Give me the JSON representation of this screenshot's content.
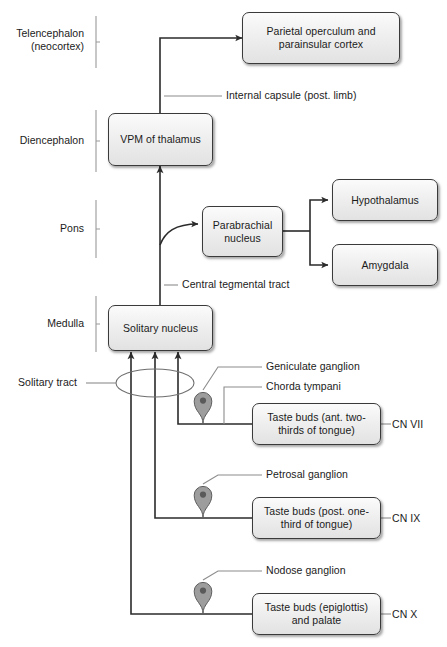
{
  "diagram": {
    "background_color": "#ffffff",
    "box_fill_top": "#fbfbfb",
    "box_fill_bottom": "#e2e2e2",
    "box_stroke": "#3a3a3a",
    "wire_color": "#2b2b2b",
    "leader_color": "#8c8c8c",
    "ganglion_fill": "#9d9d9d"
  },
  "regions": [
    {
      "id": "telencephalon",
      "label": "Telencephalon\n(neocortex)"
    },
    {
      "id": "diencephalon",
      "label": "Diencephalon"
    },
    {
      "id": "pons",
      "label": "Pons"
    },
    {
      "id": "medulla",
      "label": "Medulla"
    }
  ],
  "nodes": [
    {
      "id": "cortex",
      "label": "Parietal operculum and\nparainsular cortex"
    },
    {
      "id": "vpm",
      "label": "VPM of thalamus"
    },
    {
      "id": "parabrachial",
      "label": "Parabrachial\nnucleus"
    },
    {
      "id": "hypothalamus",
      "label": "Hypothalamus"
    },
    {
      "id": "amygdala",
      "label": "Amygdala"
    },
    {
      "id": "solitary",
      "label": "Solitary nucleus"
    },
    {
      "id": "taste7",
      "label": "Taste buds\n(ant. two-thirds of tongue)"
    },
    {
      "id": "taste9",
      "label": "Taste buds\n(post. one-third of tongue)"
    },
    {
      "id": "taste10",
      "label": "Taste buds (epiglottis)\nand palate"
    }
  ],
  "tract_labels": [
    {
      "id": "internal-capsule",
      "label": "Internal capsule (post. limb)"
    },
    {
      "id": "central-tegmental-tract",
      "label": "Central tegmental tract"
    },
    {
      "id": "solitary-tract",
      "label": "Solitary tract"
    }
  ],
  "ganglia": [
    {
      "id": "geniculate",
      "label": "Geniculate ganglion"
    },
    {
      "id": "petrosal",
      "label": "Petrosal ganglion"
    },
    {
      "id": "nodose",
      "label": "Nodose ganglion"
    }
  ],
  "nerve_branches": [
    {
      "id": "chorda-tympani",
      "label": "Chorda tympani"
    }
  ],
  "cranial_nerves": [
    {
      "id": "cn7",
      "label": "CN VII"
    },
    {
      "id": "cn9",
      "label": "CN IX"
    },
    {
      "id": "cn10",
      "label": "CN X"
    }
  ]
}
